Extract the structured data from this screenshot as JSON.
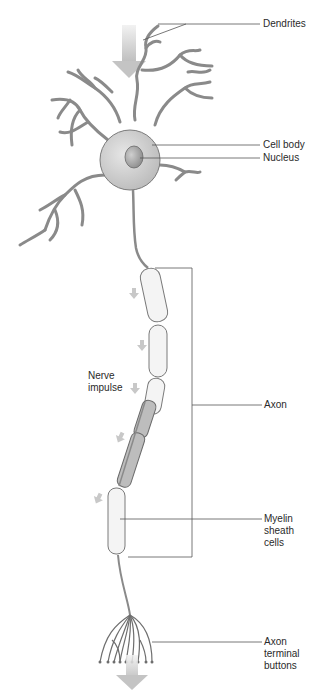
{
  "diagram": {
    "labels": {
      "dendrites": "Dendrites",
      "cell_body": "Cell body",
      "nucleus": "Nucleus",
      "nerve_impulse": "Nerve\nimpulse",
      "axon": "Axon",
      "myelin": "Myelin\nsheath\ncells",
      "terminals": "Axon\nterminal\nbuttons"
    },
    "colors": {
      "cell_fill": "#d6d6d6",
      "outline": "#6e6e6e",
      "arrow": "#c8c8c8",
      "leader_line": "#555555",
      "myelin_fill": "#f4f4f4",
      "myelin_dark": "#b9b9b9"
    }
  }
}
